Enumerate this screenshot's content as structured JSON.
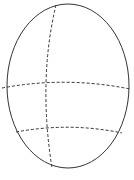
{
  "diagram": {
    "type": "ellipsoid-with-dashed-curves",
    "background": "#ffffff",
    "stroke": "#333333",
    "ellipse": {
      "cx": 68,
      "cy": 86,
      "rx": 61,
      "ry": 82
    },
    "curves": [
      {
        "name": "vertical-meridian",
        "path": "M56,5 Q38,80 52,168"
      },
      {
        "name": "upper-parallel",
        "path": "M2,88 Q66,76 130,89"
      },
      {
        "name": "lower-parallel",
        "path": "M16,132 Q70,122 122,133"
      }
    ]
  }
}
